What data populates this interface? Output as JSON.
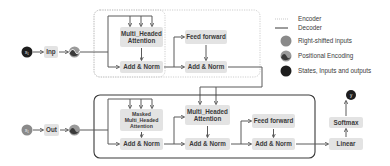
{
  "diagram": {
    "colors": {
      "node_fill": "#e3e3e3",
      "line": "#5a5a5a",
      "encoder_border": "#c8c8c8",
      "decoder_border": "#3a3a3a",
      "right_shifted": "#8a8a8a",
      "states": "#1e1e1e",
      "pos_enc_dark": "#3a3a3a",
      "pos_enc_light": "#9a9a9a"
    },
    "encoder": {
      "input_symbol": "x₁",
      "input_label": "Inp",
      "attention_label_line1": "Multi_Headed",
      "attention_label_line2": "Attention",
      "add_norm_1": "Add & Norm",
      "feed_forward": "Feed forward",
      "add_norm_2": "Add & Norm"
    },
    "decoder": {
      "input_symbol": "x₁",
      "input_label": "Out",
      "masked_attention_line1": "Masked",
      "masked_attention_line2": "Multi_Headed",
      "masked_attention_line3": "Attention",
      "add_norm_1": "Add & Norm",
      "cross_attention_line1": "Multi_Headed",
      "cross_attention_line2": "Attention",
      "add_norm_2": "Add & Norm",
      "feed_forward": "Feed forward",
      "add_norm_3": "Add & Norm"
    },
    "output_head": {
      "linear": "Linear",
      "softmax": "Softmax",
      "output_symbol": "y"
    },
    "legend": [
      {
        "label": "Encoder",
        "icon": "dotted-line-icon"
      },
      {
        "label": "Decoder",
        "icon": "solid-line-icon"
      },
      {
        "label": "Right-shifted inputs",
        "icon": "gray-circle-icon"
      },
      {
        "label": "Positional Encoding",
        "icon": "wave-circle-icon"
      },
      {
        "label": "States, Inputs and outputs",
        "icon": "black-circle-icon"
      }
    ]
  }
}
